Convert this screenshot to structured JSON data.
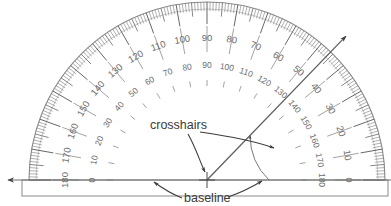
{
  "figure": {
    "type": "protractor-diagram",
    "background_color": "#ffffff",
    "line_color": "#5a5a5a",
    "tick_color": "#4a4a4a",
    "number_color": "#6b6b6b",
    "label_color": "#333333",
    "rim_color": "#7d7d7d"
  },
  "protractor": {
    "center": {
      "x": 207,
      "y": 180
    },
    "radius": 178,
    "sweep_degrees": 180,
    "minor_tick_interval": 1,
    "medium_tick_interval": 5,
    "major_tick_interval": 10,
    "outer_scale": {
      "name": "outer-scale",
      "direction": "left-to-right-ascending",
      "labels": [
        "0",
        "10",
        "20",
        "30",
        "40",
        "50",
        "60",
        "70",
        "80",
        "90",
        "100",
        "110",
        "120",
        "130",
        "140",
        "150",
        "160",
        "170",
        "180"
      ]
    },
    "inner_scale": {
      "name": "inner-scale",
      "direction": "right-to-left-ascending",
      "labels": [
        "180",
        "170",
        "160",
        "150",
        "140",
        "130",
        "120",
        "110",
        "100",
        "90",
        "80",
        "70",
        "60",
        "50",
        "40",
        "30",
        "20",
        "10",
        "0"
      ]
    }
  },
  "ray": {
    "name": "measurement-ray",
    "angle_degrees": 46,
    "length": 200,
    "has_arrowhead": true
  },
  "angle_arc": {
    "name": "angle-arc",
    "radius": 62,
    "from_degrees": 0,
    "to_degrees": 46,
    "has_arrowhead": true
  },
  "baseline": {
    "name": "baseline",
    "y": 180,
    "x_start": 8,
    "x_end": 391,
    "has_left_arrowhead": true
  },
  "callouts": [
    {
      "id": "crosshairs",
      "label": "crosshairs",
      "text_x": 150,
      "text_y": 129,
      "targets": [
        "center-crosshair",
        "ray-midpoint"
      ]
    },
    {
      "id": "baseline",
      "label": "baseline",
      "text_x": 184,
      "text_y": 202,
      "targets": [
        "baseline-left",
        "baseline-right"
      ]
    }
  ]
}
